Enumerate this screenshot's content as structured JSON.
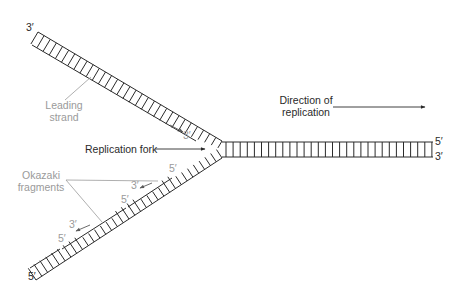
{
  "labels": {
    "top_left_end": "3′",
    "leading_strand_line1": "Leading",
    "leading_strand_line2": "strand",
    "leading_primer_end": "3′",
    "replication_fork": "Replication fork",
    "direction_line1": "Direction of",
    "direction_line2": "replication",
    "duplex_top_end": "5′",
    "duplex_bottom_end": "3′",
    "okazaki_line1": "Okazaki",
    "okazaki_line2": "fragments",
    "frag1_5prime": "5′",
    "frag1_3prime": "3′",
    "frag2_5prime": "5′",
    "frag2_3prime": "3′",
    "frag3_5prime": "5′",
    "bottom_left_end": "5′"
  },
  "colors": {
    "strand": "#2a2a2a",
    "annotation": "#9a9a9a",
    "background": "#ffffff"
  }
}
